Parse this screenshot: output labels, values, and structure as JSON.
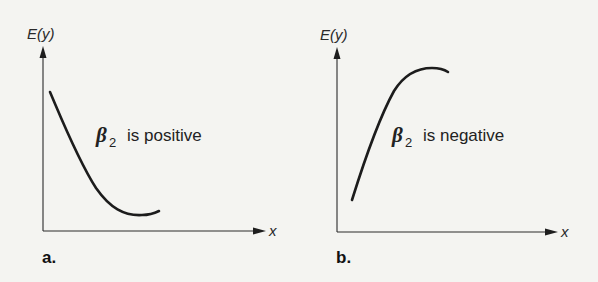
{
  "figure": {
    "panels": [
      {
        "id": "a",
        "panel_label": "a.",
        "y_axis_label": "E(y)",
        "x_axis_label": "x",
        "annotation": {
          "symbol": "β",
          "subscript": "2",
          "text": "is positive"
        },
        "curve_shape": "concave-up (decreasing then slightly increasing)"
      },
      {
        "id": "b",
        "panel_label": "b.",
        "y_axis_label": "E(y)",
        "x_axis_label": "x",
        "annotation": {
          "symbol": "β",
          "subscript": "2",
          "text": "is negative"
        },
        "curve_shape": "concave-down (increasing then leveling off)"
      }
    ]
  },
  "colors": {
    "background": "#f4f4f1",
    "ink": "#1c1c1c"
  }
}
